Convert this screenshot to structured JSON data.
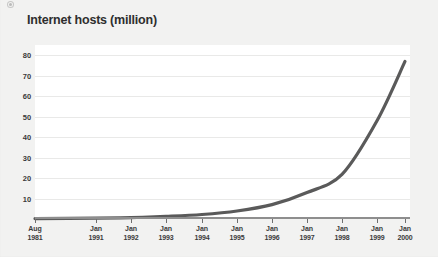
{
  "page": {
    "background_color": "#f2f2f1",
    "speck_name": "scan-artifact"
  },
  "chart_data": {
    "type": "line",
    "title": "Internet hosts (million)",
    "xlabel": "",
    "ylabel": "",
    "grid": true,
    "legend": "none",
    "line_color": "#5a5a5a",
    "plot_background": "#ffffff",
    "ylim": [
      0,
      85
    ],
    "yticks": [
      10,
      20,
      30,
      40,
      50,
      60,
      70,
      80
    ],
    "ytick_labels": [
      "10",
      "20",
      "30",
      "40",
      "50",
      "60",
      "70",
      "80"
    ],
    "categories": [
      "Aug 1981",
      "Jan 1991",
      "Jan 1992",
      "Jan 1993",
      "Jan 1994",
      "Jan 1995",
      "Jan 1996",
      "Jan 1997",
      "Jan 1998",
      "Jan 1999",
      "Jan 2000"
    ],
    "xtick_labels_line1": [
      "Aug",
      "Jan",
      "Jan",
      "Jan",
      "Jan",
      "Jan",
      "Jan",
      "Jan",
      "Jan",
      "Jan",
      "Jan"
    ],
    "xtick_labels_line2": [
      "1981",
      "1991",
      "1992",
      "1993",
      "1994",
      "1995",
      "1996",
      "1997",
      "1998",
      "1999",
      "2000"
    ],
    "xtick_positions_px": [
      0,
      61,
      96,
      131,
      167,
      202,
      237,
      272,
      307,
      342,
      370
    ],
    "values": [
      0.2,
      0.4,
      0.7,
      1.3,
      2.2,
      3.9,
      7.0,
      12.9,
      21.8,
      48.0,
      77.0
    ],
    "series": [
      {
        "name": "Internet hosts (million)",
        "values": [
          0.2,
          0.4,
          0.7,
          1.3,
          2.2,
          3.9,
          7.0,
          12.9,
          21.8,
          48.0,
          77.0
        ]
      }
    ],
    "annotations": []
  }
}
